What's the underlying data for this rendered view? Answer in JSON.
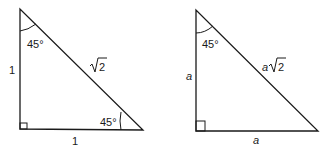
{
  "diagram": {
    "type": "special-right-triangles",
    "triangles": [
      {
        "id": "unit",
        "angle_top": "45°",
        "angle_right": "45°",
        "leg_vertical": "1",
        "leg_horizontal": "1",
        "hypotenuse_coef": "",
        "hypotenuse_radical": "2"
      },
      {
        "id": "general",
        "angle_top": "45°",
        "leg_vertical": "a",
        "leg_horizontal": "a",
        "hypotenuse_coef": "a",
        "hypotenuse_radical": "2"
      }
    ],
    "colors": {
      "stroke": "#1a1a1a",
      "background": "#ffffff"
    }
  }
}
